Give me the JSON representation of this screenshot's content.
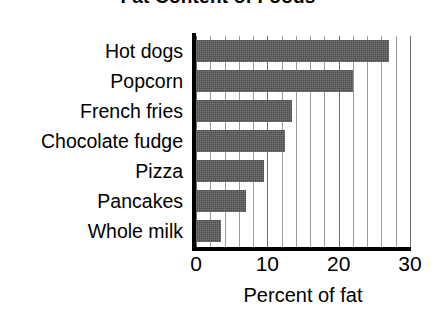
{
  "chart_data": {
    "type": "bar",
    "orientation": "horizontal",
    "title": "Fat Content of Foods",
    "xlabel": "Percent of fat",
    "ylabel": "",
    "categories": [
      "Hot dogs",
      "Popcorn",
      "French fries",
      "Chocolate fudge",
      "Pizza",
      "Pancakes",
      "Whole milk"
    ],
    "values": [
      27,
      22,
      13.5,
      12.5,
      9.5,
      7,
      3.5
    ],
    "xlim": [
      0,
      30
    ],
    "xticks": [
      0,
      10,
      20,
      30
    ],
    "xtick_labels": [
      "0",
      "10",
      "20",
      "30"
    ],
    "minor_gridline_step": 2,
    "grid": true,
    "grid_axis": "x",
    "legend": false,
    "bar_color": "#4f4f4f",
    "axis_color": "#000000",
    "gridline_color": "#9a9a9a",
    "background": "#ffffff"
  }
}
